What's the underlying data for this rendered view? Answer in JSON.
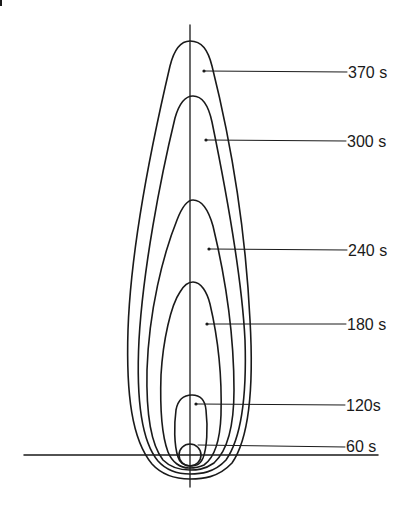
{
  "diagram": {
    "colors": {
      "line": "#1a1a1a",
      "background": "#ffffff"
    },
    "contours": [
      {
        "time": "370 s",
        "label": "370 s"
      },
      {
        "time": "300 s",
        "label": "300 s"
      },
      {
        "time": "240 s",
        "label": "240 s"
      },
      {
        "time": "180 s",
        "label": "180 s"
      },
      {
        "time": "120s",
        "label": "120s"
      },
      {
        "time": "60 s",
        "label": "60 s"
      }
    ]
  }
}
